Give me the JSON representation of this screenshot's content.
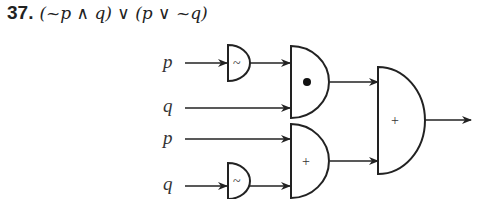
{
  "problem": {
    "number": "37.",
    "expression": "(~p ∧ q) ∨ (p ∨ ~q)"
  },
  "diagram": {
    "inputs": [
      {
        "label": "p",
        "row": 1
      },
      {
        "label": "q",
        "row": 2
      },
      {
        "label": "p",
        "row": 3
      },
      {
        "label": "q",
        "row": 4
      }
    ],
    "gates": {
      "not_top": {
        "symbol": "~"
      },
      "and_gate": {
        "symbol": "•"
      },
      "or_gate_lower": {
        "symbol": "+"
      },
      "not_bottom": {
        "symbol": "~"
      },
      "or_gate_final": {
        "symbol": "+"
      }
    },
    "colors": {
      "stroke": "#222222",
      "background": "#ffffff"
    }
  }
}
